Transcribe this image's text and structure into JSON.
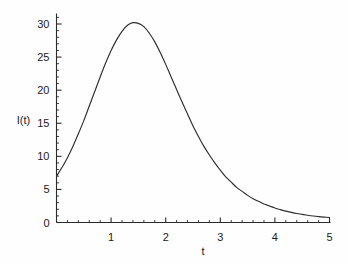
{
  "chart_data": {
    "type": "line",
    "title": "",
    "xlabel": "t",
    "ylabel": "I(t)",
    "xlim": [
      0,
      5
    ],
    "ylim": [
      0,
      32
    ],
    "grid": false,
    "legend": null,
    "x_ticks": [
      1,
      2,
      3,
      4,
      5
    ],
    "x_tick_labels": [
      "1",
      "2",
      "3",
      "4",
      "5"
    ],
    "y_ticks": [
      0,
      5,
      10,
      15,
      20,
      25,
      30
    ],
    "y_tick_labels": [
      "0",
      "5",
      "10",
      "15",
      "20",
      "25",
      "30"
    ],
    "x_minor_step": 0.2,
    "y_minor_step": 1,
    "series": [
      {
        "name": "I(t)",
        "color": "#2d2d2d",
        "x": [
          0,
          0.1,
          0.2,
          0.3,
          0.4,
          0.5,
          0.6,
          0.7,
          0.8,
          0.9,
          1.0,
          1.1,
          1.2,
          1.3,
          1.4,
          1.5,
          1.6,
          1.7,
          1.8,
          1.9,
          2.0,
          2.1,
          2.2,
          2.3,
          2.4,
          2.5,
          2.6,
          2.7,
          2.8,
          2.9,
          3.0,
          3.1,
          3.2,
          3.3,
          3.4,
          3.5,
          3.6,
          3.7,
          3.8,
          3.9,
          4.0,
          4.1,
          4.2,
          4.3,
          4.4,
          4.5,
          4.6,
          4.7,
          4.8,
          4.9,
          5.0
        ],
        "y": [
          7.0,
          8.3,
          9.8,
          11.5,
          13.4,
          15.4,
          17.6,
          19.8,
          22.0,
          24.1,
          26.0,
          27.6,
          28.9,
          29.8,
          30.2,
          30.1,
          29.6,
          28.6,
          27.3,
          25.7,
          23.9,
          22.0,
          20.1,
          18.2,
          16.4,
          14.6,
          13.0,
          11.5,
          10.2,
          9.0,
          7.9,
          6.9,
          6.1,
          5.3,
          4.7,
          4.1,
          3.6,
          3.2,
          2.8,
          2.5,
          2.2,
          1.95,
          1.72,
          1.53,
          1.36,
          1.22,
          1.09,
          0.98,
          0.89,
          0.82,
          0.76
        ]
      }
    ],
    "peak": {
      "t": 1.4,
      "value": 30.2
    },
    "start_value": 7.0,
    "end_value": 0.76
  },
  "figure": {
    "background_color": "#fefefe",
    "axis_color": "#2b2b2b",
    "text_color": "#1b1b1b",
    "curve_color": "#2d2d2d"
  }
}
